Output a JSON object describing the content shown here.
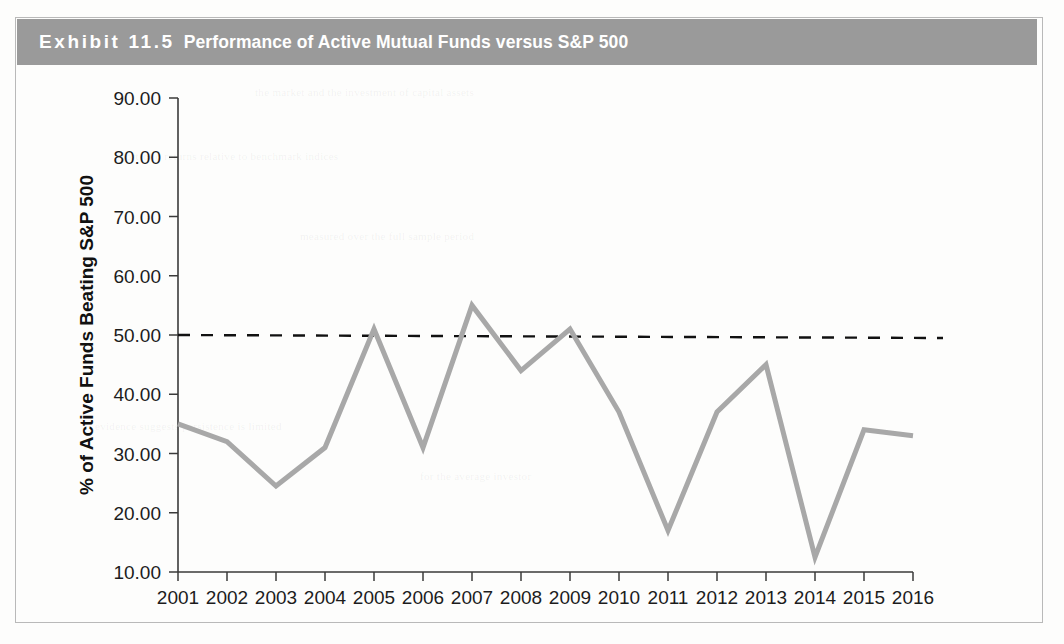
{
  "exhibit": {
    "label": "Exhibit 11.5",
    "title": "Performance of Active Mutual Funds versus S&P 500",
    "header_bg": "#9a9a9a",
    "header_text_color": "#ffffff",
    "frame_border_color": "#b9b9b9"
  },
  "chart_data": {
    "type": "line",
    "title": "Performance of Active Mutual Funds versus S&P 500",
    "xlabel": "",
    "ylabel": "% of Active Funds Beating S&P 500",
    "categories": [
      "2001",
      "2002",
      "2003",
      "2004",
      "2005",
      "2006",
      "2007",
      "2008",
      "2009",
      "2010",
      "2011",
      "2012",
      "2013",
      "2014",
      "2015",
      "2016"
    ],
    "series": [
      {
        "name": "% of Active Funds Beating S&P 500",
        "color": "#a8a8a8",
        "line_width": 5,
        "values": [
          35.0,
          32.0,
          24.5,
          31.0,
          51.0,
          31.0,
          55.0,
          44.0,
          51.0,
          37.0,
          17.0,
          37.0,
          45.0,
          12.5,
          34.0,
          33.0
        ]
      }
    ],
    "reference_line": {
      "name": "50% threshold",
      "value": 50.0,
      "style": "dashed",
      "color": "#111111",
      "line_width": 2.4,
      "dash_pattern": "12 11"
    },
    "ylim": [
      10,
      90
    ],
    "ytick_step": 10,
    "ytick_labels": [
      "90.00",
      "80.00",
      "70.00",
      "60.00",
      "50.00",
      "40.00",
      "30.00",
      "20.00",
      "10.00"
    ],
    "ytick_values": [
      90,
      80,
      70,
      60,
      50,
      40,
      30,
      20,
      10
    ],
    "xtick_labels": [
      "2001",
      "2002",
      "2003",
      "2004",
      "2005",
      "2006",
      "2007",
      "2008",
      "2009",
      "2010",
      "2011",
      "2012",
      "2013",
      "2014",
      "2015",
      "2016"
    ],
    "grid": false,
    "legend": "none",
    "axis_color": "#3a3a3a"
  },
  "geometry": {
    "axis_x": 178,
    "axis_y_top": 98,
    "axis_y_bottom": 572,
    "x_step": 49,
    "x_first": 178
  }
}
